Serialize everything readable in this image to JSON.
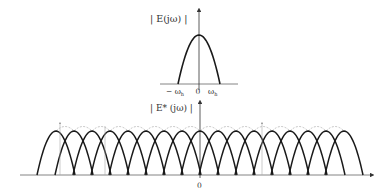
{
  "top_plot": {
    "ylabel": "| E(jω) |",
    "xticks": [
      "−ω_h",
      "0",
      "ω_h"
    ],
    "xtick_display": {
      "neg": "− ω",
      "neg_sub": "h",
      "zero": "0",
      "pos": "ω",
      "pos_sub": "h"
    },
    "axis_y": 84,
    "axis_x_center": 199,
    "lobe_half_width": 21,
    "peak_y": 35
  },
  "bottom_plot": {
    "ylabel": "| E* (jω) |",
    "xtick_zero": "0",
    "axis_y": 175,
    "axis_x_start": 37,
    "axis_x_end": 370,
    "zero_x": 200,
    "peak_y": 131,
    "lobe_spacing": 18,
    "lobe_half_width": 19,
    "lobe_count": 17,
    "first_center": 56
  },
  "colors": {
    "stroke": "#1a1a1a",
    "axis": "#666666",
    "dashed": "#aaaaaa"
  }
}
